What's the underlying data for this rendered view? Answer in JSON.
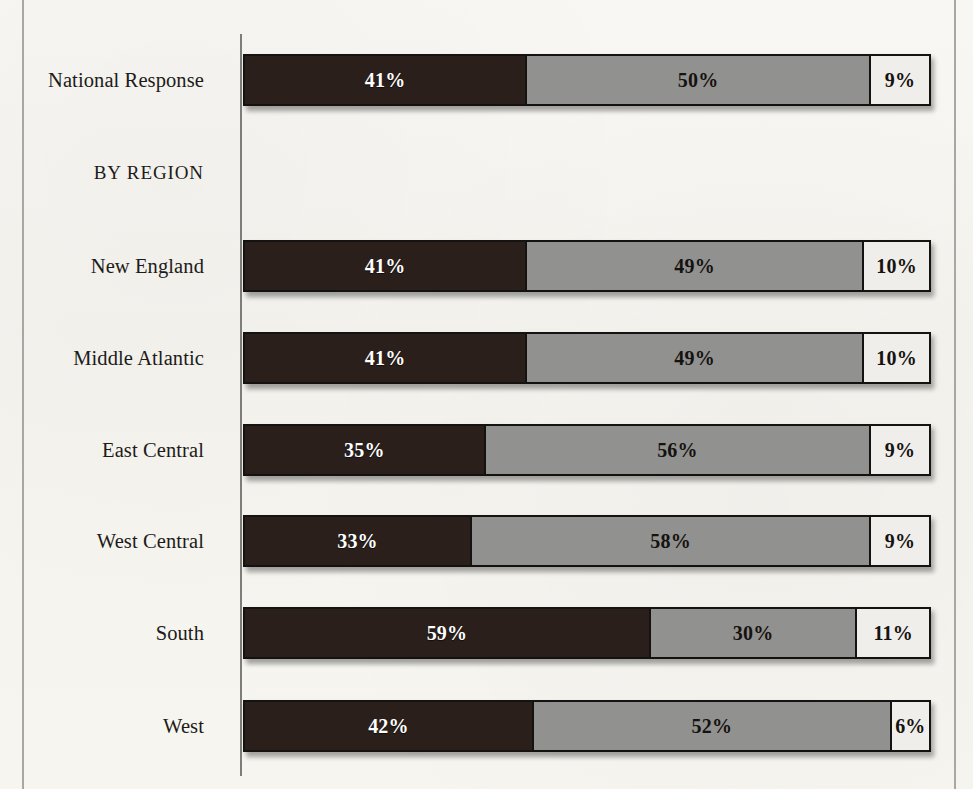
{
  "chart_data": {
    "type": "bar",
    "subtype": "stacked-horizontal-100pct",
    "title": "",
    "subtitle": "",
    "xlabel": "",
    "ylabel": "",
    "xlim": [
      0,
      100
    ],
    "grid": false,
    "legend_position": "none",
    "value_suffix": "%",
    "categories": [
      "National Response",
      "BY REGION",
      "New England",
      "Middle Atlantic",
      "East Central",
      "West Central",
      "South",
      "West"
    ],
    "series": [
      {
        "name": "dark",
        "color": "#2a1f1b",
        "values": [
          41,
          null,
          41,
          41,
          35,
          33,
          59,
          42
        ]
      },
      {
        "name": "gray",
        "color": "#919190",
        "values": [
          50,
          null,
          49,
          49,
          56,
          58,
          30,
          52
        ]
      },
      {
        "name": "light",
        "color": "#efeeea",
        "values": [
          9,
          null,
          10,
          10,
          9,
          9,
          11,
          6
        ]
      }
    ]
  },
  "chart": {
    "rows": [
      {
        "label": "National Response",
        "is_section": false,
        "has_bar": true,
        "segments": [
          {
            "value": 41,
            "label": "41%",
            "style": "seg-dark"
          },
          {
            "value": 50,
            "label": "50%",
            "style": "seg-gray"
          },
          {
            "value": 9,
            "label": "9%",
            "style": "seg-light"
          }
        ]
      },
      {
        "label": "BY REGION",
        "is_section": true,
        "has_bar": false,
        "segments": []
      },
      {
        "label": "New England",
        "is_section": false,
        "has_bar": true,
        "segments": [
          {
            "value": 41,
            "label": "41%",
            "style": "seg-dark"
          },
          {
            "value": 49,
            "label": "49%",
            "style": "seg-gray"
          },
          {
            "value": 10,
            "label": "10%",
            "style": "seg-light"
          }
        ]
      },
      {
        "label": "Middle Atlantic",
        "is_section": false,
        "has_bar": true,
        "segments": [
          {
            "value": 41,
            "label": "41%",
            "style": "seg-dark"
          },
          {
            "value": 49,
            "label": "49%",
            "style": "seg-gray"
          },
          {
            "value": 10,
            "label": "10%",
            "style": "seg-light"
          }
        ]
      },
      {
        "label": "East Central",
        "is_section": false,
        "has_bar": true,
        "segments": [
          {
            "value": 35,
            "label": "35%",
            "style": "seg-dark"
          },
          {
            "value": 56,
            "label": "56%",
            "style": "seg-gray"
          },
          {
            "value": 9,
            "label": "9%",
            "style": "seg-light"
          }
        ]
      },
      {
        "label": "West Central",
        "is_section": false,
        "has_bar": true,
        "segments": [
          {
            "value": 33,
            "label": "33%",
            "style": "seg-dark"
          },
          {
            "value": 58,
            "label": "58%",
            "style": "seg-gray"
          },
          {
            "value": 9,
            "label": "9%",
            "style": "seg-light"
          }
        ]
      },
      {
        "label": "South",
        "is_section": false,
        "has_bar": true,
        "segments": [
          {
            "value": 59,
            "label": "59%",
            "style": "seg-dark"
          },
          {
            "value": 30,
            "label": "30%",
            "style": "seg-gray"
          },
          {
            "value": 11,
            "label": "11%",
            "style": "seg-light"
          }
        ]
      },
      {
        "label": "West",
        "is_section": false,
        "has_bar": true,
        "segments": [
          {
            "value": 42,
            "label": "42%",
            "style": "seg-dark"
          },
          {
            "value": 52,
            "label": "52%",
            "style": "seg-gray"
          },
          {
            "value": 6,
            "label": "6%",
            "style": "seg-light"
          }
        ]
      }
    ],
    "row_tops": [
      51,
      144,
      237,
      329,
      421,
      512,
      604,
      697
    ]
  },
  "colors": {
    "page_background": "#f6f5f1",
    "segment_dark": "#2a1f1b",
    "segment_gray": "#919190",
    "segment_light": "#efeeea",
    "bar_outline": "#151311",
    "axis_line": "#7e7d79",
    "label_text": "#1d1b19"
  }
}
